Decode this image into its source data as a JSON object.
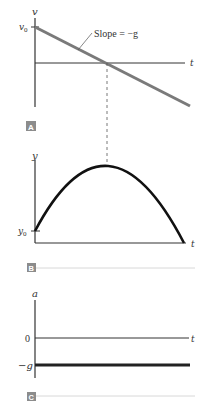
{
  "panels": [
    {
      "id": "A",
      "badge": "A",
      "y_axis_label": "v",
      "y_tick_label": "v0",
      "y_tick_sub": "0",
      "x_axis_label": "t",
      "annotation": "Slope = −g",
      "line_color": "#7a7a7a"
    },
    {
      "id": "B",
      "badge": "B",
      "y_axis_label": "y",
      "y_tick_label": "y0",
      "y_tick_sub": "0",
      "x_axis_label": "t",
      "curve_color": "#111111"
    },
    {
      "id": "C",
      "badge": "C",
      "y_axis_label": "a",
      "zero_label": "0",
      "neg_label": "−g",
      "x_axis_label": "t",
      "line_color": "#222222"
    }
  ],
  "colors": {
    "axis": "#333333",
    "badge_bg": "#8c8c8c",
    "separator": "#d8d8d8"
  },
  "text": {
    "v_letter": "v",
    "v0_main": "v",
    "sub0": "0",
    "y_letter": "y",
    "y0_main": "y",
    "a_letter": "a",
    "t_letter": "t",
    "slope": "Slope = −g",
    "zero": "0",
    "neg_g": "−g",
    "badge_A": "A",
    "badge_B": "B",
    "badge_C": "C"
  }
}
